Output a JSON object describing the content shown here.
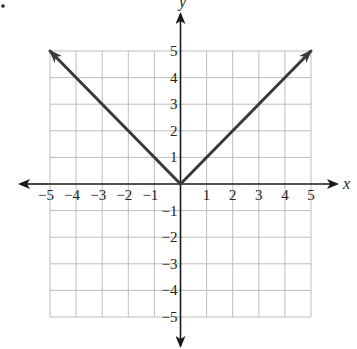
{
  "chart_data": {
    "type": "line",
    "title": "",
    "xlabel": "x",
    "ylabel": "y",
    "xlim": [
      -5,
      5
    ],
    "ylim": [
      -5,
      5
    ],
    "grid": true,
    "x_ticks": [
      -5,
      -4,
      -3,
      -2,
      -1,
      1,
      2,
      3,
      4,
      5
    ],
    "y_ticks": [
      -5,
      -4,
      -3,
      -2,
      -1,
      1,
      2,
      3,
      4,
      5
    ],
    "x_tick_labels": [
      "−5",
      "−4",
      "−3",
      "−2",
      "−1",
      "1",
      "2",
      "3",
      "4",
      "5"
    ],
    "y_tick_labels": [
      "−5",
      "−4",
      "−3",
      "−2",
      "−1",
      "1",
      "2",
      "3",
      "4",
      "5"
    ],
    "series": [
      {
        "name": "y = |x|",
        "x": [
          -5,
          -4,
          -3,
          -2,
          -1,
          0,
          1,
          2,
          3,
          4,
          5
        ],
        "y": [
          5,
          4,
          3,
          2,
          1,
          0,
          1,
          2,
          3,
          4,
          5
        ],
        "arrows_at_ends": true
      }
    ]
  },
  "colors": {
    "grid": "#bdbdbd",
    "axis": "#1a1a1a",
    "line": "#3a3a3a"
  },
  "layout": {
    "origin_px": [
      180.5,
      184
    ],
    "unit_px_x": 26.1,
    "unit_px_y": 26.6
  }
}
